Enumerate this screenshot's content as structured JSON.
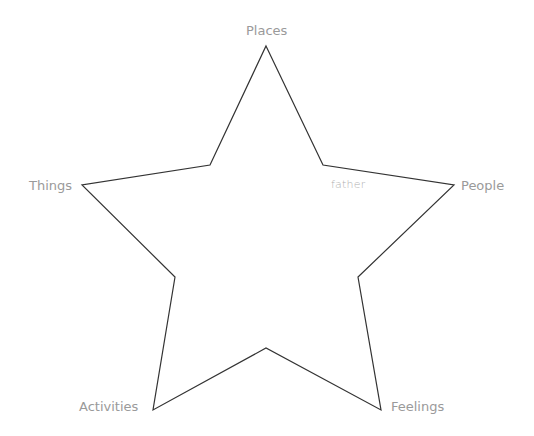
{
  "diagram": {
    "type": "star",
    "stroke_color": "#333333",
    "label_color": "#9a9a9a",
    "points": {
      "top": "Places",
      "right": "People",
      "bottom_right": "Feelings",
      "bottom_left": "Activities",
      "left": "Things"
    },
    "labels": [
      {
        "key": "places",
        "text": "Places"
      },
      {
        "key": "people",
        "text": "People"
      },
      {
        "key": "feelings",
        "text": "Feelings"
      },
      {
        "key": "activities",
        "text": "Activities"
      },
      {
        "key": "things",
        "text": "Things"
      }
    ],
    "entries": [
      {
        "text": "father",
        "near": "People"
      }
    ]
  }
}
